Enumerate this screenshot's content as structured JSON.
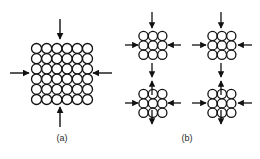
{
  "figure": {
    "title": "",
    "background_color": "#ffffff",
    "ink_color": "#111111",
    "circle_fill": "#ffffff",
    "circle_stroke": "#111111",
    "panels": [
      {
        "id": "a",
        "label": "(a)",
        "description": "Single large block of atoms under uniform compression",
        "grid": {
          "columns": 6,
          "rows": 6,
          "circle_count": 36
        },
        "arrows": [
          {
            "name": "top-arrow",
            "direction": "down",
            "points_toward": "block"
          },
          {
            "name": "bottom-arrow",
            "direction": "up",
            "points_toward": "block"
          },
          {
            "name": "left-arrow",
            "direction": "right",
            "points_toward": "block"
          },
          {
            "name": "right-arrow",
            "direction": "left",
            "points_toward": "block"
          }
        ]
      },
      {
        "id": "b",
        "label": "(b)",
        "description": "Four separated clusters of atoms, each compressed inward, with arrows between clusters pointing outward",
        "clusters": [
          {
            "name": "cluster-top-left",
            "columns": 3,
            "rows": 3,
            "circle_count": 9
          },
          {
            "name": "cluster-top-right",
            "columns": 3,
            "rows": 3,
            "circle_count": 9
          },
          {
            "name": "cluster-bottom-left",
            "columns": 3,
            "rows": 3,
            "circle_count": 9
          },
          {
            "name": "cluster-bottom-right",
            "columns": 3,
            "rows": 3,
            "circle_count": 9
          }
        ],
        "arrows": [
          {
            "name": "tl-top-arrow",
            "direction": "down"
          },
          {
            "name": "tl-left-arrow",
            "direction": "right"
          },
          {
            "name": "tl-right-arrow",
            "direction": "left"
          },
          {
            "name": "tl-bottom-arrow",
            "direction": "down"
          },
          {
            "name": "tr-top-arrow",
            "direction": "down"
          },
          {
            "name": "tr-left-arrow",
            "direction": "right"
          },
          {
            "name": "tr-right-arrow",
            "direction": "left"
          },
          {
            "name": "tr-bottom-arrow",
            "direction": "down"
          },
          {
            "name": "bl-top-arrow",
            "direction": "up"
          },
          {
            "name": "bl-left-arrow",
            "direction": "right"
          },
          {
            "name": "bl-right-arrow",
            "direction": "left"
          },
          {
            "name": "bl-bottom-arrow",
            "direction": "up"
          },
          {
            "name": "br-top-arrow",
            "direction": "up"
          },
          {
            "name": "br-left-arrow",
            "direction": "right"
          },
          {
            "name": "br-right-arrow",
            "direction": "left"
          },
          {
            "name": "br-bottom-arrow",
            "direction": "up"
          }
        ]
      }
    ]
  },
  "captions": {
    "panel_a": "(a)",
    "panel_b": "(b)"
  }
}
